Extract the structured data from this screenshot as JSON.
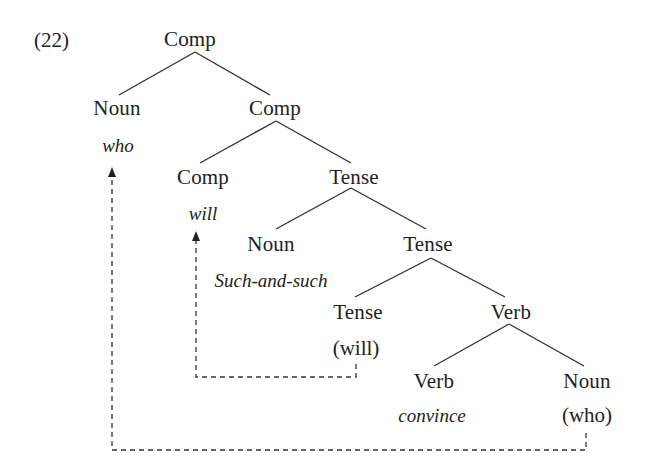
{
  "example_number": "(22)",
  "tree": {
    "root": {
      "label": "Comp"
    },
    "spec_noun": {
      "label": "Noun",
      "word": "who"
    },
    "comp_bar": {
      "label": "Comp"
    },
    "comp_head": {
      "label": "Comp",
      "word": "will"
    },
    "tense_phrase": {
      "label": "Tense"
    },
    "subject_noun": {
      "label": "Noun",
      "word": "Such-and-such"
    },
    "tense_bar": {
      "label": "Tense"
    },
    "tense_head": {
      "label": "Tense",
      "word": "(will)"
    },
    "verb_phrase": {
      "label": "Verb"
    },
    "verb_head": {
      "label": "Verb",
      "word": "convince"
    },
    "object_noun": {
      "label": "Noun",
      "word": "(who)"
    }
  },
  "movements": [
    {
      "from": "(will)",
      "to": "will",
      "style": "dashed-arrow"
    },
    {
      "from": "(who)",
      "to": "who",
      "style": "dashed-arrow"
    }
  ],
  "colors": {
    "ink": "#222222",
    "background": "#ffffff"
  }
}
